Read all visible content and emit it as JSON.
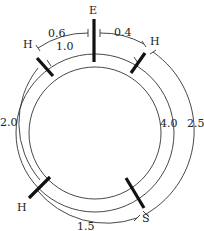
{
  "diagram": {
    "type": "circular distance diagram",
    "nodes": [
      {
        "id": "E",
        "label": "E",
        "position": "top"
      },
      {
        "id": "H1",
        "label": "H",
        "position": "upper-left"
      },
      {
        "id": "H2",
        "label": "H",
        "position": "upper-right"
      },
      {
        "id": "H3",
        "label": "H",
        "position": "lower-left"
      },
      {
        "id": "S",
        "label": "S",
        "position": "lower-right"
      }
    ],
    "distances": [
      {
        "from": "H1",
        "to": "E",
        "label": "0.6"
      },
      {
        "from": "E",
        "to": "H2",
        "label": "0.4"
      },
      {
        "from": "H1",
        "to": "H2",
        "label": "1.0"
      },
      {
        "from": "H1",
        "to": "H3",
        "label": "2.0"
      },
      {
        "from": "H2",
        "to": "S",
        "label": "4.0"
      },
      {
        "from": "H2",
        "to": "S",
        "label": "2.5",
        "route": "outer"
      },
      {
        "from": "H3",
        "to": "S",
        "label": "1.5"
      }
    ]
  }
}
